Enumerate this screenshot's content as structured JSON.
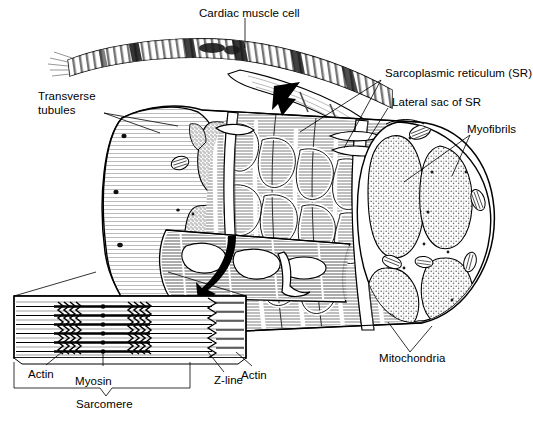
{
  "figure": {
    "width": 533,
    "height": 429,
    "background": "#ffffff",
    "ink": "#000000",
    "stipple_color": "#8a8a8a",
    "hatch_color": "#9a9a9a"
  },
  "labels": {
    "cardiac_muscle_cell": "Cardiac muscle cell",
    "sarcoplasmic_reticulum": "Sarcoplasmic reticulum (SR)",
    "lateral_sac": "Lateral sac of SR",
    "myofibrils": "Myofibrils",
    "transverse_tubules_line1": "Transverse",
    "transverse_tubules_line2": "tubules",
    "mitochondria": "Mitochondria",
    "actin_left": "Actin",
    "myosin": "Myosin",
    "actin_right": "Actin",
    "z_line": "Z-line",
    "sarcomere": "Sarcomere"
  },
  "inset": {
    "name": "sarcomere-detail",
    "filament_rows": 6,
    "myosin_band_count": 1,
    "crossbridge_clusters": 2,
    "z_line_position": "right",
    "center_dots": 6
  },
  "structures": [
    {
      "name": "cardiac-muscle-fiber",
      "description": "curved striated fiber with intercalated discs"
    },
    {
      "name": "cell-cylinder",
      "description": "cut-away cylindrical cardiac muscle cell"
    },
    {
      "name": "myofibril-cross-section",
      "description": "stippled lobed myofibril bundles"
    },
    {
      "name": "sr-network",
      "description": "lacy sarcoplasmic reticulum mesh over myofibrils"
    },
    {
      "name": "mitochondria-ovals",
      "description": "small cristae-filled ovals at cell periphery"
    },
    {
      "name": "t-tubule-openings",
      "description": "black dots on cell surface"
    }
  ]
}
